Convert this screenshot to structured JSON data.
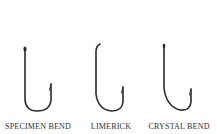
{
  "hooks": [
    {
      "name": "SPECIMEN BEND"
    },
    {
      "name": "LIMERICK"
    },
    {
      "name": "CRYSTAL BEND"
    }
  ],
  "colors": {
    "hook": "#2b2b2b",
    "label": "#2f2f2f",
    "background": "#ffffff"
  }
}
